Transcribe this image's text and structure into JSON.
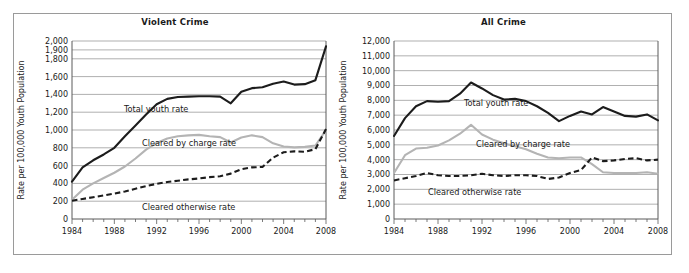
{
  "figure": {
    "border_color": "#9a9a9a",
    "background": "#ffffff"
  },
  "chart_data": [
    {
      "type": "line",
      "title": "Violent Crime",
      "xlabel": "",
      "ylabel": "Rate per 100,000 Youth Population",
      "xlim": [
        1984,
        2008
      ],
      "ylim": [
        0,
        2000
      ],
      "ytick_labels": [
        "0",
        "200",
        "400",
        "600",
        "800",
        "1,000",
        "1,200",
        "1,400",
        "1,600",
        "1,800",
        "1,900",
        "2,000"
      ],
      "yticks": [
        0,
        200,
        400,
        600,
        800,
        1000,
        1200,
        1400,
        1600,
        1800,
        1900,
        2000
      ],
      "xtick_labels": [
        "1984",
        "1988",
        "1992",
        "1996",
        "2000",
        "2004",
        "2008"
      ],
      "xticks": [
        1984,
        1988,
        1992,
        1996,
        2000,
        2004,
        2008
      ],
      "grid": "horizontal",
      "legend_position": "inline-annotations",
      "x": [
        1984,
        1985,
        1986,
        1987,
        1988,
        1989,
        1990,
        1991,
        1992,
        1993,
        1994,
        1995,
        1996,
        1997,
        1998,
        1999,
        2000,
        2001,
        2002,
        2003,
        2004,
        2005,
        2006,
        2007,
        2008
      ],
      "series": [
        {
          "name": "Total youth rate",
          "color": "#1c1c1c",
          "style": "solid",
          "values": [
            420,
            580,
            660,
            725,
            800,
            930,
            1050,
            1175,
            1290,
            1350,
            1370,
            1375,
            1380,
            1380,
            1375,
            1300,
            1430,
            1470,
            1480,
            1520,
            1545,
            1510,
            1515,
            1560,
            1940,
            1905
          ],
          "label_text": "Total youth rate"
        },
        {
          "name": "Cleared by charge rate",
          "color": "#b4b4b4",
          "style": "solid",
          "values": [
            215,
            330,
            400,
            460,
            520,
            590,
            680,
            780,
            855,
            905,
            930,
            940,
            945,
            930,
            920,
            860,
            915,
            940,
            920,
            850,
            815,
            805,
            810,
            825,
            1000,
            950
          ],
          "label_text": "Cleared by charge rate"
        },
        {
          "name": "Cleared otherwise rate",
          "color": "#1c1c1c",
          "style": "dashed",
          "values": [
            205,
            225,
            245,
            265,
            285,
            310,
            340,
            370,
            395,
            415,
            430,
            445,
            455,
            470,
            480,
            510,
            560,
            580,
            585,
            690,
            750,
            760,
            755,
            785,
            1010,
            1030
          ],
          "label_text": "Cleared otherwise rate"
        }
      ]
    },
    {
      "type": "line",
      "title": "All Crime",
      "xlabel": "",
      "ylabel": "Rate per 100,000 Youth Population",
      "xlim": [
        1984,
        2008
      ],
      "ylim": [
        0,
        12000
      ],
      "ytick_labels": [
        "0",
        "1,000",
        "2,000",
        "3,000",
        "4,000",
        "5,000",
        "6,000",
        "7,000",
        "8,000",
        "9,000",
        "10,000",
        "11,000",
        "12,000"
      ],
      "yticks": [
        0,
        1000,
        2000,
        3000,
        4000,
        5000,
        6000,
        7000,
        8000,
        9000,
        10000,
        11000,
        12000
      ],
      "xtick_labels": [
        "1984",
        "1988",
        "1992",
        "1996",
        "2000",
        "2004",
        "2008"
      ],
      "xticks": [
        1984,
        1988,
        1992,
        1996,
        2000,
        2004,
        2008
      ],
      "grid": "horizontal",
      "legend_position": "inline-annotations",
      "x": [
        1984,
        1985,
        1986,
        1987,
        1988,
        1989,
        1990,
        1991,
        1992,
        1993,
        1994,
        1995,
        1996,
        1997,
        1998,
        1999,
        2000,
        2001,
        2002,
        2003,
        2004,
        2005,
        2006,
        2007,
        2008
      ],
      "series": [
        {
          "name": "Total youth rate",
          "color": "#1c1c1c",
          "style": "solid",
          "values": [
            5600,
            6800,
            7600,
            7950,
            7900,
            7950,
            8450,
            9200,
            8800,
            8350,
            8050,
            8100,
            7950,
            7600,
            7150,
            6600,
            6950,
            7250,
            7050,
            7550,
            7250,
            6950,
            6900,
            7050,
            6650
          ],
          "label_text": "Total youth rate"
        },
        {
          "name": "Cleared by charge rate",
          "color": "#b4b4b4",
          "style": "solid",
          "values": [
            3100,
            4300,
            4750,
            4800,
            4950,
            5300,
            5750,
            6350,
            5700,
            5350,
            5100,
            4900,
            4700,
            4400,
            4150,
            4100,
            4150,
            4150,
            3700,
            3150,
            3100,
            3100,
            3100,
            3150,
            3050
          ],
          "label_text": "Cleared by charge rate"
        },
        {
          "name": "Cleared otherwise rate",
          "color": "#1c1c1c",
          "style": "dashed",
          "values": [
            2600,
            2750,
            2900,
            3100,
            2950,
            2900,
            2900,
            2950,
            3050,
            2950,
            2900,
            2950,
            2950,
            2900,
            2700,
            2800,
            3100,
            3300,
            4150,
            3900,
            3950,
            4050,
            4100,
            3950,
            4000
          ],
          "label_text": "Cleared otherwise rate"
        }
      ]
    }
  ]
}
